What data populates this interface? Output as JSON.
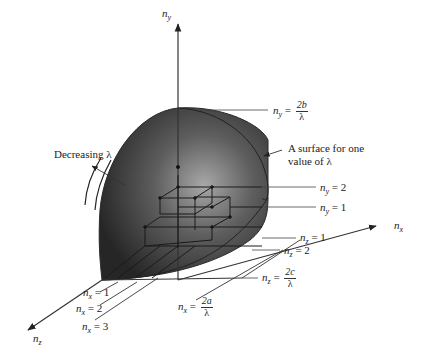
{
  "figure": {
    "colors": {
      "surface_dark": "#2a2a2a",
      "surface_light": "#9a9a9a",
      "lines": "#333333",
      "background": "#ffffff"
    },
    "axes": {
      "y": {
        "var": "n",
        "sub": "y"
      },
      "x": {
        "var": "n",
        "sub": "x"
      },
      "z": {
        "var": "n",
        "sub": "z"
      }
    },
    "intercepts": {
      "ny": {
        "lhs_var": "n",
        "lhs_sub": "y",
        "eq": "=",
        "num": "2b",
        "den": "λ"
      },
      "nz": {
        "lhs_var": "n",
        "lhs_sub": "z",
        "eq": "=",
        "num": "2c",
        "den": "λ"
      },
      "nx": {
        "lhs_var": "n",
        "lhs_sub": "x",
        "eq": "=",
        "num": "2a",
        "den": "λ"
      }
    },
    "annotations": {
      "surface_label_line1": "A surface for one",
      "surface_label_line2": "value of λ",
      "decreasing_label": "Decreasing λ"
    },
    "level_labels": {
      "ny": [
        {
          "var": "n",
          "sub": "y",
          "value": "= 2"
        },
        {
          "var": "n",
          "sub": "y",
          "value": "= 1"
        }
      ],
      "nz": [
        {
          "var": "n",
          "sub": "z",
          "value": "= 1"
        },
        {
          "var": "n",
          "sub": "z",
          "value": "= 2"
        }
      ],
      "nx": [
        {
          "var": "n",
          "sub": "x",
          "value": "= 1"
        },
        {
          "var": "n",
          "sub": "x",
          "value": "= 2"
        },
        {
          "var": "n",
          "sub": "x",
          "value": "= 3"
        }
      ]
    }
  }
}
